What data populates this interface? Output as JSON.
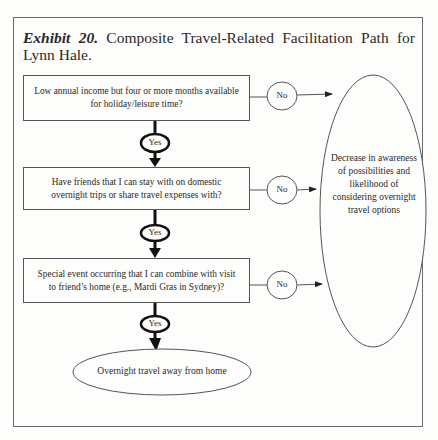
{
  "exhibit": {
    "label": "Exhibit 20.",
    "title": "Composite Travel-Related Facilitation Path for Lynn Hale."
  },
  "diagram": {
    "questions": [
      {
        "text": "Low annual income but four or more months available for holiday/leisure time?",
        "yes_label": "Yes",
        "no_label": "No"
      },
      {
        "text": "Have friends that I can stay with on domestic overnight trips or share travel expenses with?",
        "yes_label": "Yes",
        "no_label": "No"
      },
      {
        "text": "Special event occurring that I can combine with visit to friend’s home (e.g., Mardi Gras in Sydney)?",
        "yes_label": "Yes",
        "no_label": "No"
      }
    ],
    "yes_outcome": "Overnight travel away from home",
    "no_outcome": "Decrease in awareness of possibilities and likelihood of considering overnight travel options"
  }
}
